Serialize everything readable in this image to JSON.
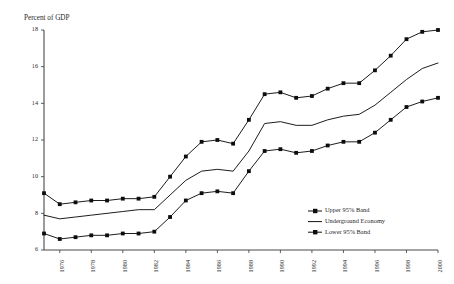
{
  "chart_data": {
    "type": "line",
    "title": "",
    "ylabel": "Percent of GDP",
    "xlabel": "",
    "ylim": [
      6,
      18
    ],
    "yticks": [
      6,
      8,
      10,
      12,
      14,
      16,
      18
    ],
    "grid": false,
    "legend_position": "inside-bottom-right",
    "x": [
      1975,
      1976,
      1977,
      1978,
      1979,
      1980,
      1981,
      1982,
      1983,
      1984,
      1985,
      1986,
      1987,
      1988,
      1989,
      1990,
      1991,
      1992,
      1993,
      1994,
      1995,
      1996,
      1997,
      1998,
      1999,
      2000
    ],
    "xticks": [
      1976,
      1978,
      1980,
      1982,
      1984,
      1986,
      1988,
      1990,
      1992,
      1994,
      1996,
      1998,
      2000
    ],
    "xtick_labels": [
      "1976",
      "1978",
      "1980",
      "1982",
      "1984",
      "1986",
      "1988",
      "1990",
      "1992",
      "1994",
      "1996",
      "1998",
      "2000"
    ],
    "series": [
      {
        "name": "Upper 95% Band",
        "marker": "square",
        "values": [
          9.1,
          8.5,
          8.6,
          8.7,
          8.7,
          8.8,
          8.8,
          8.9,
          10.0,
          11.1,
          11.9,
          12.0,
          11.8,
          13.1,
          14.5,
          14.6,
          14.3,
          14.4,
          14.8,
          15.1,
          15.1,
          15.8,
          16.6,
          17.5,
          17.9,
          18.0
        ]
      },
      {
        "name": "Underground Economy",
        "marker": "none",
        "values": [
          7.9,
          7.7,
          7.8,
          7.9,
          8.0,
          8.1,
          8.2,
          8.2,
          9.0,
          9.8,
          10.3,
          10.4,
          10.3,
          11.4,
          12.9,
          13.0,
          12.8,
          12.8,
          13.1,
          13.3,
          13.4,
          13.9,
          14.6,
          15.3,
          15.9,
          16.2
        ]
      },
      {
        "name": "Lower 95% Band",
        "marker": "square",
        "values": [
          6.9,
          6.6,
          6.7,
          6.8,
          6.8,
          6.9,
          6.9,
          7.0,
          7.8,
          8.7,
          9.1,
          9.2,
          9.1,
          10.3,
          11.4,
          11.5,
          11.3,
          11.4,
          11.7,
          11.9,
          11.9,
          12.4,
          13.1,
          13.8,
          14.1,
          14.3
        ]
      }
    ],
    "legend": [
      {
        "label": "Upper 95% Band",
        "marker": "square"
      },
      {
        "label": "Underground Economy",
        "marker": "none"
      },
      {
        "label": "Lower 95% Band",
        "marker": "square"
      }
    ]
  }
}
